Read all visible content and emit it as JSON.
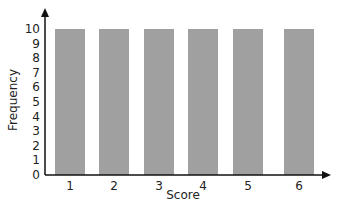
{
  "chart_data": {
    "type": "bar",
    "title": "",
    "xlabel": "Score",
    "ylabel": "Frequency",
    "categories": [
      "1",
      "2",
      "3",
      "4",
      "5",
      "6"
    ],
    "values": [
      10,
      10,
      10,
      10,
      10,
      10
    ],
    "ylim": [
      0,
      10
    ],
    "yticks": [
      "0",
      "1",
      "2",
      "3",
      "4",
      "5",
      "6",
      "7",
      "8",
      "9",
      "10"
    ],
    "grid": false,
    "bar_color": "#a0a0a0"
  }
}
